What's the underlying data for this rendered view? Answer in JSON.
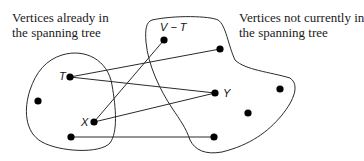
{
  "captions": {
    "left": {
      "line1": "Vertices already in",
      "line2": "the spanning tree"
    },
    "right": {
      "line1": "Vertices not currently in",
      "line2": "the spanning tree"
    }
  },
  "labels": {
    "set_label": "V − T",
    "t": "T",
    "x": "X",
    "y": "Y"
  },
  "colors": {
    "stroke": "#2a2a2a",
    "vertex": "#000000",
    "background": "#ffffff"
  },
  "graph": {
    "sets": [
      {
        "id": "tree-set",
        "name": "Vertices already in the spanning tree"
      },
      {
        "id": "non-tree-set",
        "name": "Vertices not currently in the spanning tree",
        "label": "V − T"
      }
    ],
    "vertices": [
      {
        "id": "T",
        "set": "tree-set",
        "x": 70,
        "y": 77
      },
      {
        "id": "left",
        "set": "tree-set",
        "x": 38,
        "y": 101
      },
      {
        "id": "X",
        "set": "tree-set",
        "x": 94,
        "y": 122
      },
      {
        "id": "bottom-left",
        "set": "tree-set",
        "x": 71,
        "y": 137
      },
      {
        "id": "top",
        "set": "non-tree-set",
        "x": 164,
        "y": 40
      },
      {
        "id": "top-right",
        "set": "non-tree-set",
        "x": 220,
        "y": 49
      },
      {
        "id": "Y",
        "set": "non-tree-set",
        "x": 215,
        "y": 93
      },
      {
        "id": "far-right",
        "set": "non-tree-set",
        "x": 280,
        "y": 89
      },
      {
        "id": "mid-right",
        "set": "non-tree-set",
        "x": 248,
        "y": 113
      },
      {
        "id": "bottom-right",
        "set": "non-tree-set",
        "x": 214,
        "y": 137
      }
    ],
    "edges": [
      {
        "from": "T",
        "to": "top-right"
      },
      {
        "from": "T",
        "to": "Y"
      },
      {
        "from": "X",
        "to": "top"
      },
      {
        "from": "X",
        "to": "Y"
      },
      {
        "from": "bottom-left",
        "to": "bottom-right"
      }
    ]
  }
}
